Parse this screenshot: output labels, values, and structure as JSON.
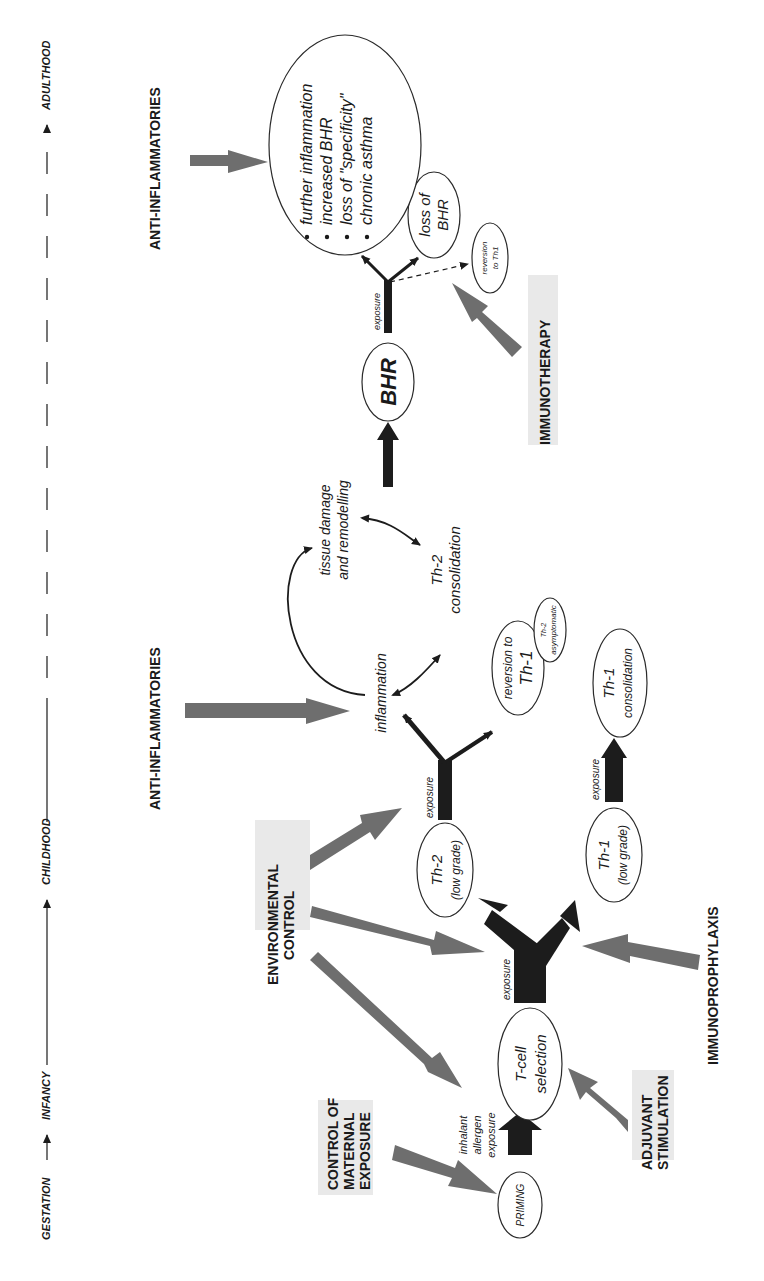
{
  "timeline": {
    "stages": [
      "GESTATION",
      "INFANCY",
      "CHILDHOOD",
      "ADULTHOOD"
    ]
  },
  "interventions": {
    "control_maternal": [
      "CONTROL OF",
      "MATERNAL",
      "EXPOSURE"
    ],
    "adjuvant": [
      "ADJUVANT",
      "STIMULATION"
    ],
    "environmental": [
      "ENVIRONMENTAL",
      "CONTROL"
    ],
    "immunoprophylaxis": "IMMUNOPROPHYLAXIS",
    "anti_inflammatories_1": "ANTI-INFLAMMATORIES",
    "anti_inflammatories_2": "ANTI-INFLAMMATORIES",
    "immunotherapy": "IMMUNOTHERAPY"
  },
  "nodes": {
    "priming": "PRIMING",
    "inhalant": [
      "inhalant",
      "allergen",
      "exposure"
    ],
    "tcell": [
      "T-cell",
      "selection"
    ],
    "exposure_label": "exposure",
    "th2_low": [
      "Th-2",
      "(low grade)"
    ],
    "th1_low": [
      "Th-1",
      "(low grade)"
    ],
    "inflammation": "inflammation",
    "tissue": [
      "tissue damage",
      "and remodelling"
    ],
    "th2_consolidation": [
      "Th-2",
      "consolidation"
    ],
    "reversion_th1": [
      "reversion to",
      "Th-1"
    ],
    "th2_asymptomatic": [
      "Th-2",
      "asymptomatic"
    ],
    "th1_consolidation": [
      "Th-1",
      "consolidation"
    ],
    "bhr": "BHR",
    "loss_bhr": [
      "loss of",
      "BHR"
    ],
    "reversion_th1_small": [
      "reversion",
      "to Th1"
    ],
    "outcomes": [
      "further inflammation",
      "increased BHR",
      "loss of \"specificity\"",
      "chronic asthma"
    ]
  },
  "colors": {
    "intervention_arrow": "#6e6e6e",
    "pathway_arrow": "#1c1c1c",
    "background": "#ffffff"
  }
}
